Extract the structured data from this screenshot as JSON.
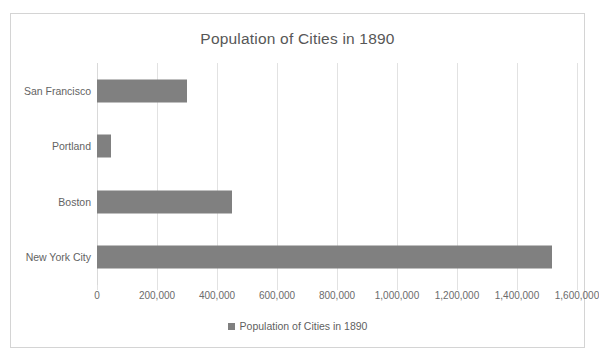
{
  "chart_data": {
    "type": "bar",
    "orientation": "horizontal",
    "title": "Population of Cities in 1890",
    "categories": [
      "San Francisco",
      "Portland",
      "Boston",
      "New York City"
    ],
    "values": [
      298997,
      46385,
      448477,
      1515301
    ],
    "series": [
      {
        "name": "Population of Cities in 1890",
        "values": [
          298997,
          46385,
          448477,
          1515301
        ]
      }
    ],
    "xlabel": "",
    "ylabel": "",
    "xlim": [
      0,
      1600000
    ],
    "xticks": [
      0,
      200000,
      400000,
      600000,
      800000,
      1000000,
      1200000,
      1400000,
      1600000
    ],
    "xticklabels": [
      "0",
      "200,000",
      "400,000",
      "600,000",
      "800,000",
      "1,000,000",
      "1,200,000",
      "1,400,000",
      "1,600,000"
    ],
    "grid": "vertical",
    "legend": {
      "position": "bottom",
      "entries": [
        {
          "label": "Population of Cities in 1890",
          "color": "#808080"
        }
      ]
    },
    "colors": {
      "bar": "#808080",
      "gridline": "#e2e2e2",
      "title_text": "#575757",
      "tick_text": "#6b6b6b",
      "frame_border": "#d4d4d4",
      "background": "#ffffff"
    }
  },
  "legend": {
    "label": "Population of Cities in 1890"
  }
}
